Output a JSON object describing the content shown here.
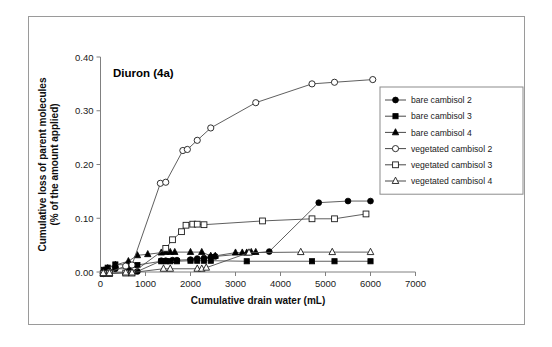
{
  "figure": {
    "title": "Diuron (4a)",
    "frame": true
  },
  "chart_data": {
    "type": "scatter",
    "title": "Diuron (4a)",
    "xlabel": "Cumulative drain water (mL)",
    "ylabel": "Cumulative loss of parent molecules\n(% of the amount applied)",
    "ylabel_line1": "Cumulative loss of parent molecules",
    "ylabel_line2": "(% of the amount applied)",
    "xlim": [
      0,
      7000
    ],
    "ylim": [
      0.0,
      0.4
    ],
    "xticks": [
      0,
      1000,
      2000,
      3000,
      4000,
      5000,
      6000,
      7000
    ],
    "xticklabels": [
      "0",
      "1000",
      "2000",
      "3000",
      "4000",
      "5000",
      "6000",
      "7000"
    ],
    "yticks": [
      0.0,
      0.1,
      0.2,
      0.3,
      0.4
    ],
    "yticklabels": [
      "0.00",
      "0.10",
      "0.20",
      "0.30",
      "0.40"
    ],
    "grid": false,
    "legend_position": "right",
    "marker_colors": {
      "line": "#4d4d4d",
      "filled": "#000000",
      "open_fill": "#ffffff",
      "open_stroke": "#1a1a1a"
    },
    "series": [
      {
        "name": "bare cambisol 2",
        "marker": "circle-filled",
        "x": [
          80,
          160,
          330,
          620,
          820,
          1350,
          1450,
          1600,
          1700,
          2000,
          2150,
          2300,
          2450,
          2550,
          3750,
          4850,
          5500,
          6000
        ],
        "y": [
          0.002,
          0.004,
          0.006,
          0.006,
          0.001,
          0.021,
          0.021,
          0.022,
          0.022,
          0.023,
          0.025,
          0.026,
          0.028,
          0.029,
          0.038,
          0.129,
          0.132,
          0.132
        ]
      },
      {
        "name": "bare cambisol 3",
        "marker": "square-filled",
        "x": [
          80,
          160,
          330,
          620,
          820,
          1350,
          1450,
          1550,
          1700,
          2000,
          2150,
          2300,
          2450,
          3250,
          4700,
          5200,
          6000
        ],
        "y": [
          0.004,
          0.008,
          0.014,
          0.013,
          0.013,
          0.02,
          0.02,
          0.02,
          0.02,
          0.021,
          0.021,
          0.021,
          0.021,
          0.02,
          0.02,
          0.02,
          0.02
        ]
      },
      {
        "name": "bare cambisol 4",
        "marker": "triangle-filled",
        "x": [
          80,
          160,
          330,
          620,
          820,
          1050,
          1350,
          1450,
          1550,
          1650,
          2000,
          2250,
          2450,
          2550,
          3000,
          3150,
          3250,
          3350,
          3450
        ],
        "y": [
          0.003,
          0.007,
          0.013,
          0.02,
          0.031,
          0.033,
          0.036,
          0.037,
          0.037,
          0.037,
          0.037,
          0.037,
          0.03,
          0.03,
          0.036,
          0.036,
          0.036,
          0.037,
          0.037
        ]
      },
      {
        "name": "vegetated cambisol 2",
        "marker": "circle-open",
        "x": [
          60,
          200,
          560,
          700,
          1330,
          1450,
          1830,
          1930,
          2150,
          2450,
          3450,
          4700,
          5200,
          6050
        ],
        "y": [
          -0.003,
          0.0,
          0.011,
          0.013,
          0.165,
          0.167,
          0.226,
          0.228,
          0.245,
          0.268,
          0.315,
          0.35,
          0.353,
          0.358
        ]
      },
      {
        "name": "vegetated cambisol 3",
        "marker": "square-open",
        "x": [
          60,
          200,
          560,
          700,
          1450,
          1600,
          1800,
          1900,
          2050,
          2150,
          2300,
          3600,
          4700,
          5200,
          5900
        ],
        "y": [
          -0.003,
          -0.003,
          -0.002,
          -0.002,
          0.044,
          0.06,
          0.075,
          0.087,
          0.089,
          0.089,
          0.088,
          0.095,
          0.099,
          0.099,
          0.108
        ]
      },
      {
        "name": "vegetated cambisol 4",
        "marker": "triangle-open",
        "x": [
          60,
          200,
          560,
          700,
          1400,
          1550,
          2150,
          2250,
          2350,
          3300,
          4450,
          5150,
          6000
        ],
        "y": [
          -0.002,
          -0.002,
          -0.001,
          -0.001,
          0.006,
          0.006,
          0.006,
          0.006,
          0.008,
          0.036,
          0.037,
          0.037,
          0.037
        ]
      }
    ],
    "legend": [
      {
        "label": "bare cambisol 2",
        "marker": "circle-filled"
      },
      {
        "label": "bare cambisol 3",
        "marker": "square-filled"
      },
      {
        "label": "bare cambisol 4",
        "marker": "triangle-filled"
      },
      {
        "label": "vegetated cambisol 2",
        "marker": "circle-open"
      },
      {
        "label": "vegetated cambisol 3",
        "marker": "square-open"
      },
      {
        "label": "vegetated cambisol 4",
        "marker": "triangle-open"
      }
    ]
  }
}
